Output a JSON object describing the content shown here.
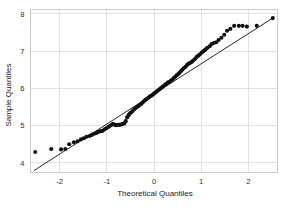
{
  "figure": {
    "background_color": "#ffffff",
    "point_color": "#111111",
    "line_color": "#111111",
    "grid_color": "#d5d5d5",
    "frame_color": "#bdbdbd"
  },
  "axis": {
    "x_title": "Theoretical Quantiles",
    "y_title": "Sample Quantiles",
    "x_ticks": [
      "-2",
      "-1",
      "0",
      "1",
      "2"
    ],
    "y_ticks": [
      "4",
      "5",
      "6",
      "7",
      "8"
    ]
  },
  "chart_data": {
    "type": "scatter",
    "title": "",
    "subtitle": "",
    "xlabel": "Theoretical Quantiles",
    "ylabel": "Sample Quantiles",
    "xlim": [
      -2.62,
      2.62
    ],
    "ylim": [
      3.74,
      8.12
    ],
    "xticks": [
      -2,
      -1,
      0,
      1,
      2
    ],
    "yticks": [
      4,
      5,
      6,
      7,
      8
    ],
    "grid": true,
    "legend": null,
    "annotations": [],
    "reference_line": {
      "name": "qq-reference-line",
      "x": [
        -2.55,
        2.52
      ],
      "y": [
        3.79,
        7.89
      ],
      "slope": 0.8077,
      "intercept": 5.8497
    },
    "series": [
      {
        "name": "sample-quantiles",
        "marker": "circle",
        "marker_size": 3.0,
        "x": [
          -2.52,
          -2.18,
          -1.97,
          -1.88,
          -1.8,
          -1.7,
          -1.62,
          -1.55,
          -1.49,
          -1.43,
          -1.37,
          -1.32,
          -1.27,
          -1.22,
          -1.18,
          -1.13,
          -1.09,
          -1.05,
          -1.01,
          -0.97,
          -0.94,
          -0.9,
          -0.87,
          -0.83,
          -0.8,
          -0.76,
          -0.73,
          -0.7,
          -0.67,
          -0.63,
          -0.6,
          -0.57,
          -0.54,
          -0.51,
          -0.48,
          -0.45,
          -0.42,
          -0.39,
          -0.36,
          -0.33,
          -0.3,
          -0.27,
          -0.24,
          -0.21,
          -0.18,
          -0.15,
          -0.12,
          -0.09,
          -0.06,
          -0.03,
          0.0,
          0.03,
          0.06,
          0.09,
          0.12,
          0.15,
          0.18,
          0.21,
          0.24,
          0.27,
          0.3,
          0.33,
          0.36,
          0.39,
          0.42,
          0.45,
          0.48,
          0.51,
          0.54,
          0.57,
          0.6,
          0.63,
          0.67,
          0.7,
          0.73,
          0.76,
          0.8,
          0.83,
          0.87,
          0.9,
          0.94,
          0.97,
          1.01,
          1.05,
          1.09,
          1.13,
          1.18,
          1.22,
          1.27,
          1.32,
          1.37,
          1.43,
          1.49,
          1.55,
          1.62,
          1.7,
          1.8,
          1.88,
          1.97,
          2.18,
          2.52
        ],
        "y": [
          4.29,
          4.37,
          4.36,
          4.37,
          4.5,
          4.55,
          4.58,
          4.63,
          4.66,
          4.7,
          4.72,
          4.75,
          4.78,
          4.8,
          4.83,
          4.85,
          4.86,
          4.9,
          4.93,
          4.96,
          4.99,
          5.02,
          5.05,
          5.02,
          5.01,
          5.02,
          5.02,
          5.03,
          5.04,
          5.06,
          5.12,
          5.22,
          5.28,
          5.33,
          5.36,
          5.4,
          5.44,
          5.47,
          5.5,
          5.53,
          5.56,
          5.59,
          5.62,
          5.66,
          5.69,
          5.72,
          5.75,
          5.78,
          5.8,
          5.83,
          5.86,
          5.89,
          5.92,
          5.95,
          5.98,
          6.01,
          6.04,
          6.07,
          6.1,
          6.13,
          6.16,
          6.18,
          6.21,
          6.24,
          6.28,
          6.31,
          6.35,
          6.38,
          6.42,
          6.46,
          6.5,
          6.54,
          6.58,
          6.63,
          6.66,
          6.68,
          6.71,
          6.75,
          6.79,
          6.84,
          6.88,
          6.91,
          6.96,
          7.0,
          7.04,
          7.09,
          7.13,
          7.19,
          7.22,
          7.24,
          7.3,
          7.36,
          7.44,
          7.55,
          7.6,
          7.68,
          7.68,
          7.68,
          7.66,
          7.68,
          7.89
        ]
      }
    ]
  }
}
